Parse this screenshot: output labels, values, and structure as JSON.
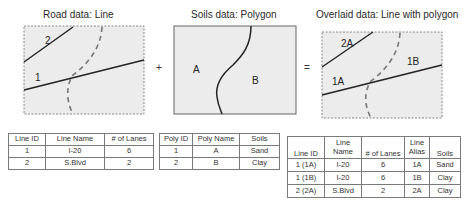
{
  "panels": {
    "road": {
      "title": "Road data: Line",
      "labels": [
        "2",
        "1"
      ]
    },
    "soils": {
      "title": "Soils data: Polygon",
      "labels": [
        "A",
        "B"
      ]
    },
    "overlay": {
      "title": "Overlaid data: Line with polygon",
      "labels": [
        "2A",
        "1A",
        "1B"
      ]
    }
  },
  "operators": {
    "plus": "+",
    "equals": "="
  },
  "colors": {
    "map_fill": "#ececec",
    "line": "#222222",
    "dashed": "#777777",
    "border": "#7a7a7a"
  },
  "road_table": {
    "headers": [
      "Line ID",
      "Line Name",
      "# of Lanes"
    ],
    "rows": [
      [
        "1",
        "I-20",
        "6"
      ],
      [
        "2",
        "S.Blvd",
        "2"
      ]
    ]
  },
  "poly_table": {
    "headers": [
      "Poly ID",
      "Poly Name",
      "Soils"
    ],
    "rows": [
      [
        "1",
        "A",
        "Sand"
      ],
      [
        "2",
        "B",
        "Clay"
      ]
    ]
  },
  "overlay_table": {
    "headers": [
      "Line ID",
      "Line Name",
      "# of Lanes",
      "Line Alias",
      "Soils"
    ],
    "rows": [
      [
        "1 (1A)",
        "I-20",
        "6",
        "1A",
        "Sand"
      ],
      [
        "1 (1B)",
        "I-20",
        "6",
        "1B",
        "Clay"
      ],
      [
        "2 (2A)",
        "S.Blvd",
        "2",
        "2A",
        "Clay"
      ]
    ]
  }
}
